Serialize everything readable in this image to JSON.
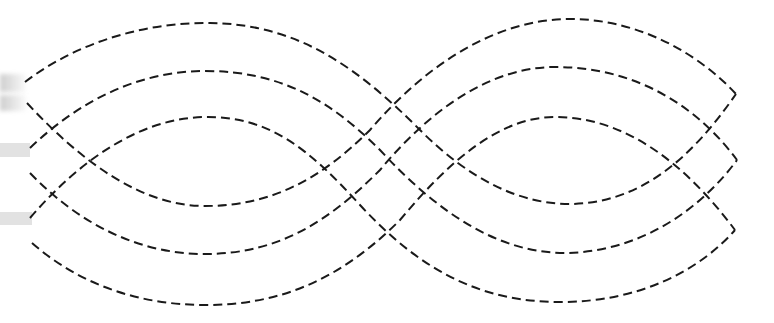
{
  "figure": {
    "stroke_color": "#1a1a1a",
    "stroke_width": 2,
    "dash_pattern": "9 5",
    "background": "#ffffff"
  },
  "strands": [
    {
      "name": "strand-top-outer-to-bottom-inner",
      "d": "M25,82 C80,40 150,22 210,23 C300,24 360,70 420,130 C470,180 520,204 570,204 C640,203 690,160 736,94"
    },
    {
      "name": "strand-top-middle-to-bottom-middle",
      "d": "M30,148 C80,100 140,71 205,71 C280,71 330,100 380,150 C440,215 500,253 565,253 C640,252 700,210 737,160"
    },
    {
      "name": "strand-top-inner-to-bottom-outer",
      "d": "M30,218 C80,160 140,118 205,117 C270,116 310,150 360,205 C420,270 480,302 560,302 C640,302 700,270 735,230"
    },
    {
      "name": "strand-bottom-inner-to-top-outer",
      "d": "M27,103 C80,160 140,206 205,206 C270,206 320,180 370,130 C430,60 500,19 570,19 C640,19 700,55 736,94"
    },
    {
      "name": "strand-bottom-middle-to-top-middle",
      "d": "M30,173 C80,225 140,254 205,254 C280,254 330,220 380,170 C430,110 490,67 555,67 C640,67 700,110 737,160"
    },
    {
      "name": "strand-bottom-outer-to-top-inner",
      "d": "M32,243 C80,285 140,305 205,305 C280,305 340,280 400,220 C450,160 500,117 555,117 C630,117 690,170 735,230"
    }
  ],
  "edge_marks": [
    {
      "name": "edge-blur-top",
      "top": 74,
      "height": 18
    },
    {
      "name": "edge-blur-second",
      "top": 95,
      "height": 16
    },
    {
      "name": "edge-bar-middle",
      "top": 143,
      "height": 14,
      "width": 30
    },
    {
      "name": "edge-bar-lower",
      "top": 212,
      "height": 13,
      "width": 32
    }
  ]
}
